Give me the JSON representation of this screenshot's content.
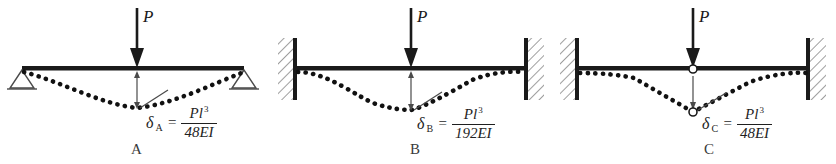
{
  "figure": {
    "type": "beam-deflection-comparison",
    "background": "#ffffff",
    "ink_color": "#1a1a1a",
    "panel_count": 3
  },
  "panels": [
    {
      "id": "A",
      "caption": "A",
      "load_label": "P",
      "support_type": "simply-supported",
      "left_support": "pin-triangle",
      "right_support": "roller-triangle",
      "has_internal_hinge": false,
      "deflection": {
        "symbol": "δ",
        "subscript": "A",
        "equals": "=",
        "numerator": "Pl",
        "numerator_exponent": "3",
        "denominator_coefficient": "48",
        "denominator_symbol": "EI",
        "denominator": "48EI",
        "full": "δ A = Pl 3 / 48EI"
      }
    },
    {
      "id": "B",
      "caption": "B",
      "load_label": "P",
      "support_type": "fixed-fixed",
      "left_support": "fixed-wall-hatched",
      "right_support": "fixed-wall-hatched",
      "has_internal_hinge": false,
      "deflection": {
        "symbol": "δ",
        "subscript": "B",
        "equals": "=",
        "numerator": "Pl",
        "numerator_exponent": "3",
        "denominator_coefficient": "192",
        "denominator_symbol": "EI",
        "denominator": "192EI",
        "full": "δ B = Pl 3 / 192EI"
      }
    },
    {
      "id": "C",
      "caption": "C",
      "load_label": "P",
      "support_type": "fixed-fixed-with-hinge",
      "left_support": "fixed-wall-hatched",
      "right_support": "fixed-wall-hatched",
      "has_internal_hinge": true,
      "deflection": {
        "symbol": "δ",
        "subscript": "C",
        "equals": "=",
        "numerator": "Pl",
        "numerator_exponent": "3",
        "denominator_coefficient": "48",
        "denominator_symbol": "EI",
        "denominator": "48EI",
        "full": "δ C = Pl 3 / 48EI"
      }
    }
  ]
}
